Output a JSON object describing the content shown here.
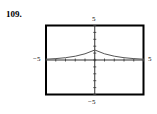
{
  "exercise": {
    "number": "109."
  },
  "chart_data": {
    "type": "line",
    "title": "",
    "xlabel": "",
    "ylabel": "",
    "xlim": [
      -5,
      5
    ],
    "ylim": [
      -5,
      5
    ],
    "grid": false,
    "tick_labels": {
      "x_min": "−5",
      "x_max": "5",
      "y_min": "−5",
      "y_max": "5"
    },
    "x_ticks": [
      -5,
      -4,
      -3,
      -2,
      -1,
      0,
      1,
      2,
      3,
      4,
      5
    ],
    "y_ticks": [
      -5,
      -4,
      -3,
      -2,
      -1,
      0,
      1,
      2,
      3,
      4,
      5
    ],
    "series": [
      {
        "name": "f(x)",
        "shape": "symmetric cusp peak at x=0 decaying toward y=0",
        "x": [
          -5,
          -4,
          -3,
          -2,
          -1,
          0,
          1,
          2,
          3,
          4,
          5
        ],
        "y": [
          0.12,
          0.2,
          0.33,
          0.55,
          0.9,
          1.45,
          0.9,
          0.55,
          0.33,
          0.2,
          0.12
        ]
      }
    ],
    "colors": {
      "frame": "#000000",
      "axes": "#333333",
      "curve": "#555555"
    }
  }
}
